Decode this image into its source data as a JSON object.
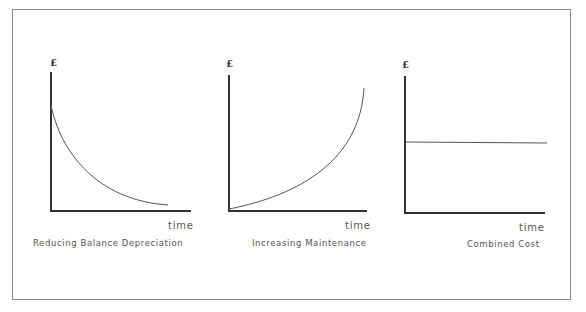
{
  "diagram": {
    "panels": [
      {
        "id": "reducing-balance",
        "y_label": "£",
        "x_label": "time",
        "caption": "Reducing Balance Depreciation",
        "curve": "decreasing-convex"
      },
      {
        "id": "increasing-maintenance",
        "y_label": "£",
        "x_label": "time",
        "caption": "Increasing Maintenance",
        "curve": "increasing-convex"
      },
      {
        "id": "combined-cost",
        "y_label": "£",
        "x_label": "time",
        "caption": "Combined Cost",
        "curve": "constant"
      }
    ],
    "colors": {
      "axis": "#333333",
      "curve": "#555555",
      "text": "#555555",
      "frame": "#8a8a8a"
    }
  }
}
